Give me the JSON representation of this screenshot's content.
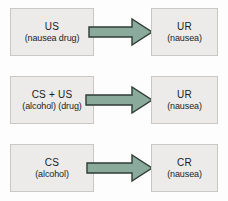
{
  "diagram": {
    "background_color": "#fdfdfd",
    "box_fill_color": "#ecebe9",
    "box_border_color": "#c9c7c4",
    "arrow_fill_color": "#8aab9c",
    "arrow_border_color": "#2f3b35",
    "text_color": "#1b1b1b",
    "rows": [
      {
        "id": "row-unconditioned",
        "left": {
          "term": "US",
          "gloss": "(nausea drug)"
        },
        "connector": {
          "icon": "right-arrow-icon",
          "label": "leads to"
        },
        "right": {
          "term": "UR",
          "gloss": "(nausea)"
        }
      },
      {
        "id": "row-pairing",
        "left": {
          "term": "CS + US",
          "gloss": "(alcohol) (drug)"
        },
        "connector": {
          "icon": "right-arrow-icon",
          "label": "leads to"
        },
        "right": {
          "term": "UR",
          "gloss": "(nausea)"
        }
      },
      {
        "id": "row-conditioned",
        "left": {
          "term": "CS",
          "gloss": "(alcohol)"
        },
        "connector": {
          "icon": "right-arrow-icon",
          "label": "leads to"
        },
        "right": {
          "term": "CR",
          "gloss": "(nausea)"
        }
      }
    ]
  }
}
